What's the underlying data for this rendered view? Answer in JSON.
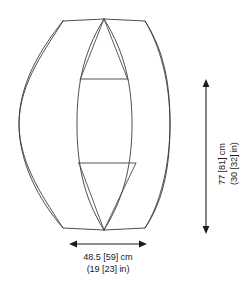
{
  "diagram": {
    "background_color": "#ffffff",
    "line_color": "#3a3a42",
    "dimension_color": "#1c1c1c",
    "shape": {
      "outer_silhouette": "rounded-octagon",
      "inner_panel": "vesica-lens",
      "crossbar_count": 2,
      "apex_top": "104,19",
      "apex_bottom": "104,230"
    }
  },
  "dimensions": {
    "height": {
      "label_metric": "77 [81] cm",
      "label_imperial": "(30 [32] in)",
      "orientation": "vertical",
      "arrow_style": "double-headed",
      "value_cm": 77,
      "alt_value_cm": 81,
      "value_in": 30,
      "alt_value_in": 32,
      "unit_metric": "cm",
      "unit_imperial": "in"
    },
    "width": {
      "label_metric": "48.5 [59] cm",
      "label_imperial": "(19 [23] in)",
      "orientation": "horizontal",
      "arrow_style": "double-headed",
      "value_cm": 48.5,
      "alt_value_cm": 59,
      "value_in": 19,
      "alt_value_in": 23,
      "unit_metric": "cm",
      "unit_imperial": "in"
    }
  }
}
